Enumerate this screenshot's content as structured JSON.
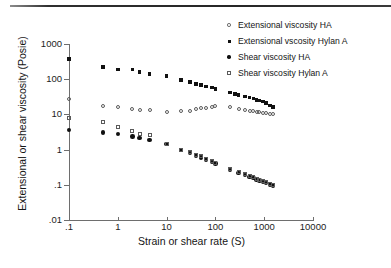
{
  "figure": {
    "top_rule": "horizontal-rule"
  },
  "chart_data": {
    "type": "scatter",
    "title": "",
    "xlabel": "Strain or shear rate (S)",
    "ylabel": "Extensional or shear viscosity (Posie)",
    "xscale": "log",
    "yscale": "log",
    "xlim": [
      0.1,
      10000
    ],
    "ylim": [
      0.01,
      1000
    ],
    "grid": false,
    "legend_position": "top-right",
    "xticks": [
      ".1",
      "1",
      "10",
      "100",
      "1000",
      "10000"
    ],
    "xtick_values": [
      0.1,
      1,
      10,
      100,
      1000,
      10000
    ],
    "yticks": [
      "1000",
      "100",
      "10",
      "1",
      ".1",
      ".01"
    ],
    "ytick_values": [
      1000,
      100,
      10,
      1,
      0.1,
      0.01
    ],
    "series": [
      {
        "name": "Extensional viscosity HA",
        "marker": "open-circle",
        "color": "#5a5a5a",
        "points": [
          [
            0.1,
            27
          ],
          [
            0.5,
            17.5
          ],
          [
            1.0,
            16.5
          ],
          [
            2.0,
            14.5
          ],
          [
            2.8,
            13.5
          ],
          [
            4.5,
            13.0
          ],
          [
            10,
            12.0
          ],
          [
            20,
            12.2
          ],
          [
            30,
            12.8
          ],
          [
            40,
            14.5
          ],
          [
            50,
            14.8
          ],
          [
            65,
            15.0
          ],
          [
            85,
            16.5
          ],
          [
            100,
            16.8
          ],
          [
            200,
            16.5
          ],
          [
            300,
            14.0
          ],
          [
            400,
            13.5
          ],
          [
            500,
            12.8
          ],
          [
            600,
            12.3
          ],
          [
            700,
            11.8
          ],
          [
            800,
            11.5
          ],
          [
            950,
            11.2
          ],
          [
            1100,
            10.8
          ],
          [
            1300,
            10.5
          ],
          [
            1500,
            10.2
          ]
        ]
      },
      {
        "name": "Extensional vscosity Hylan A",
        "marker": "filled-square",
        "color": "#111111",
        "points": [
          [
            0.1,
            380
          ],
          [
            0.5,
            225
          ],
          [
            1.0,
            190
          ],
          [
            2.0,
            188
          ],
          [
            2.8,
            160
          ],
          [
            4.5,
            140
          ],
          [
            10,
            125
          ],
          [
            20,
            95
          ],
          [
            30,
            82
          ],
          [
            40,
            72
          ],
          [
            50,
            68
          ],
          [
            65,
            62
          ],
          [
            85,
            58
          ],
          [
            100,
            52
          ],
          [
            200,
            42
          ],
          [
            250,
            38
          ],
          [
            300,
            35
          ],
          [
            400,
            32
          ],
          [
            500,
            30
          ],
          [
            600,
            28
          ],
          [
            700,
            26
          ],
          [
            800,
            25
          ],
          [
            950,
            23
          ],
          [
            1100,
            21
          ],
          [
            1300,
            18
          ],
          [
            1500,
            16
          ]
        ]
      },
      {
        "name": "Shear viscosity HA",
        "marker": "filled-circle",
        "color": "#111111",
        "points": [
          [
            0.1,
            3.6
          ],
          [
            0.5,
            3.1
          ],
          [
            1.0,
            2.8
          ],
          [
            2.0,
            2.35
          ],
          [
            2.8,
            2.15
          ],
          [
            4.5,
            1.85
          ],
          [
            10,
            1.42
          ],
          [
            20,
            0.98
          ],
          [
            30,
            0.8
          ],
          [
            40,
            0.68
          ],
          [
            50,
            0.6
          ],
          [
            65,
            0.52
          ],
          [
            85,
            0.45
          ],
          [
            100,
            0.4
          ],
          [
            200,
            0.265
          ],
          [
            300,
            0.215
          ],
          [
            400,
            0.19
          ],
          [
            500,
            0.17
          ],
          [
            600,
            0.155
          ],
          [
            700,
            0.143
          ],
          [
            800,
            0.133
          ],
          [
            950,
            0.122
          ],
          [
            1100,
            0.113
          ],
          [
            1300,
            0.103
          ],
          [
            1500,
            0.095
          ]
        ]
      },
      {
        "name": "Shear viscosity Hylan A",
        "marker": "open-square",
        "color": "#5a5a5a",
        "points": [
          [
            0.1,
            7.8
          ],
          [
            0.5,
            6.2
          ],
          [
            1.0,
            4.3
          ],
          [
            2.0,
            3.3
          ],
          [
            2.8,
            2.8
          ],
          [
            4.5,
            2.55
          ],
          [
            10,
            1.48
          ],
          [
            20,
            1.0
          ],
          [
            30,
            0.85
          ],
          [
            40,
            0.72
          ],
          [
            50,
            0.64
          ],
          [
            65,
            0.55
          ],
          [
            85,
            0.48
          ],
          [
            100,
            0.42
          ],
          [
            200,
            0.275
          ],
          [
            300,
            0.225
          ],
          [
            400,
            0.198
          ],
          [
            500,
            0.178
          ],
          [
            600,
            0.162
          ],
          [
            700,
            0.15
          ],
          [
            800,
            0.14
          ],
          [
            950,
            0.128
          ],
          [
            1100,
            0.118
          ],
          [
            1300,
            0.108
          ],
          [
            1500,
            0.1
          ]
        ]
      }
    ]
  }
}
